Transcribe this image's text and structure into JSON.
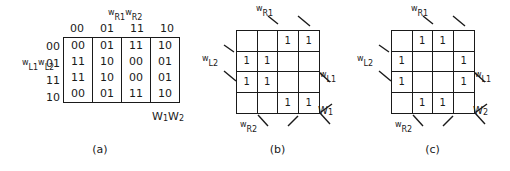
{
  "figure": {
    "panels": [
      {
        "id": "a",
        "caption": "(a)",
        "type": "truth-table",
        "col_group_label": {
          "prefix1": "w",
          "sub1": "R1",
          "prefix2": "w",
          "sub2": "R2"
        },
        "row_group_label": {
          "prefix1": "w",
          "sub1": "L1",
          "prefix2": "w",
          "sub2": "L2"
        },
        "output_label": {
          "prefix1": "W",
          "sub1": "1",
          "prefix2": "W",
          "sub2": "2"
        },
        "column_headers": [
          "00",
          "01",
          "11",
          "10"
        ],
        "row_headers": [
          "00",
          "01",
          "11",
          "10"
        ],
        "cells": [
          [
            "00",
            "01",
            "11",
            "10"
          ],
          [
            "11",
            "10",
            "00",
            "01"
          ],
          [
            "11",
            "10",
            "00",
            "01"
          ],
          [
            "00",
            "01",
            "11",
            "10"
          ]
        ]
      },
      {
        "id": "b",
        "caption": "(b)",
        "type": "karnaugh-map",
        "labels": {
          "top": {
            "prefix": "w",
            "sub": "R1"
          },
          "left": {
            "prefix": "w",
            "sub": "L2"
          },
          "right": {
            "prefix": "w",
            "sub": "L1"
          },
          "bottom": {
            "prefix": "w",
            "sub": "R2"
          },
          "output": {
            "prefix": "W",
            "sub": "1"
          }
        },
        "grid": [
          [
            "",
            "",
            "1",
            "1"
          ],
          [
            "1",
            "1",
            "",
            ""
          ],
          [
            "1",
            "1",
            "",
            ""
          ],
          [
            "",
            "",
            "1",
            "1"
          ]
        ]
      },
      {
        "id": "c",
        "caption": "(c)",
        "type": "karnaugh-map",
        "labels": {
          "top": {
            "prefix": "w",
            "sub": "R1"
          },
          "left": {
            "prefix": "w",
            "sub": "L2"
          },
          "right": {
            "prefix": "w",
            "sub": "L1"
          },
          "bottom": {
            "prefix": "w",
            "sub": "R2"
          },
          "output": {
            "prefix": "W",
            "sub": "2"
          }
        },
        "grid": [
          [
            "",
            "1",
            "1",
            ""
          ],
          [
            "1",
            "",
            "",
            "1"
          ],
          [
            "1",
            "",
            "",
            "1"
          ],
          [
            "",
            "1",
            "1",
            ""
          ]
        ]
      }
    ],
    "colors": {
      "ink": "#1a1a1a",
      "background": "#ffffff"
    }
  }
}
